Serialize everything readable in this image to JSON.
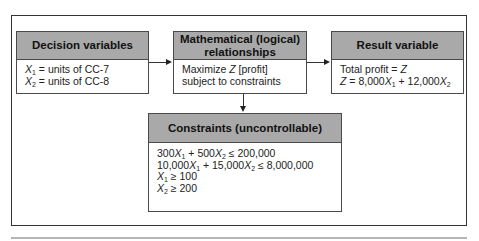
{
  "diagram": {
    "decision_box": {
      "title": "Decision variables",
      "lines": [
        {
          "var": "X",
          "sub": "1",
          "text": " = units of CC-7"
        },
        {
          "var": "X",
          "sub": "2",
          "text": " = units of CC-8"
        }
      ]
    },
    "math_box": {
      "title_line1": "Mathematical (logical)",
      "title_line2": "relationships",
      "line1_pre": "Maximize ",
      "line1_var": "Z",
      "line1_post": " [profit]",
      "line2": "subject to constraints"
    },
    "result_box": {
      "title": "Result variable",
      "line1_pre": "Total profit = ",
      "line1_var": "Z",
      "line2": {
        "z": "Z",
        "eq": " = 8,000",
        "x1": "X",
        "x1_sub": "1",
        "plus": " + 12,000",
        "x2": "X",
        "x2_sub": "2"
      }
    },
    "constraints_box": {
      "title": "Constraints (uncontrollable)",
      "c1": {
        "a": "300",
        "x1": "X",
        "s1": "1",
        "b": " + 500",
        "x2": "X",
        "s2": "2",
        "rhs": " ≤ 200,000"
      },
      "c2": {
        "a": "10,000",
        "x1": "X",
        "s1": "1",
        "b": " + 15,000",
        "x2": "X",
        "s2": "2",
        "rhs": " ≤ 8,000,000"
      },
      "c3": {
        "x": "X",
        "s": "1",
        "rhs": " ≥ 100"
      },
      "c4": {
        "x": "X",
        "s": "2",
        "rhs": " ≥ 200"
      }
    },
    "colors": {
      "header_fill": "#a9a9a9",
      "border": "#4a4a4a",
      "frame": "#333333",
      "rule": "#b5b5b5"
    }
  }
}
